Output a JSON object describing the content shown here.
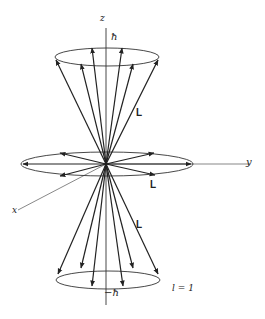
{
  "diagram": {
    "type": "vector-model-angular-momentum",
    "axes": {
      "z_label": "z",
      "y_label": "y",
      "x_label": "x"
    },
    "top_cone": {
      "projection_label": "ħ"
    },
    "bottom_cone": {
      "projection_label": "−ħ"
    },
    "vector_labels": [
      "L",
      "L",
      "L"
    ],
    "quantum_number_label": "l = 1",
    "colors": {
      "line": "#222222",
      "background": "#ffffff"
    }
  }
}
